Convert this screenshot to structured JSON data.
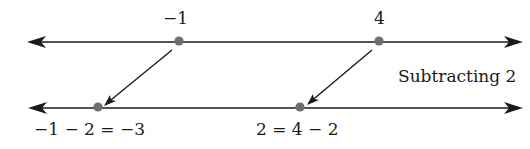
{
  "diagram": {
    "operation_label": "Subtracting 2",
    "top_line": {
      "points": [
        {
          "value": "−1",
          "x": 179
        },
        {
          "value": "4",
          "x": 379
        }
      ]
    },
    "bottom_line": {
      "points": [
        {
          "label": "−1 − 2 = −3",
          "x": 98
        },
        {
          "label": "2 = 4 − 2",
          "x": 300
        }
      ]
    },
    "colors": {
      "line": "#1a1a1a",
      "dot": "#6e6e6e"
    }
  }
}
